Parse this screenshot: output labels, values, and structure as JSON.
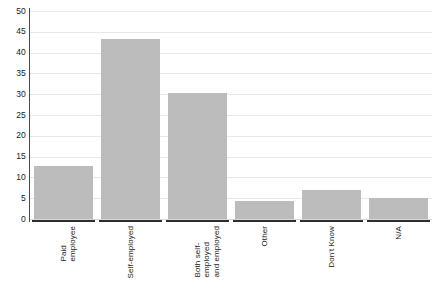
{
  "chart_data": {
    "type": "bar",
    "title": "",
    "subtitle": "",
    "xlabel": "",
    "ylabel": "",
    "categories": [
      "Paid\nemployee",
      "Self-employed",
      "Both self-\nemployed\nand employed",
      "Other",
      "Don't Know",
      "N/A"
    ],
    "values": [
      12.7,
      43.2,
      30.2,
      4.3,
      7.0,
      5.1
    ],
    "ylim": [
      0,
      50
    ],
    "yticks": [
      0,
      5,
      10,
      15,
      20,
      25,
      30,
      35,
      40,
      45,
      50
    ],
    "ytick_labels": [
      "0",
      "5",
      "10",
      "15",
      "20",
      "25",
      "30",
      "35",
      "40",
      "45",
      "50"
    ],
    "grid": true,
    "legend": false,
    "legend_position": "none",
    "bar_color": "#bcbcbc",
    "gridline_color": "#e8e8e8",
    "axis_color": "#2e2e2e",
    "background_color": "#ffffff"
  }
}
